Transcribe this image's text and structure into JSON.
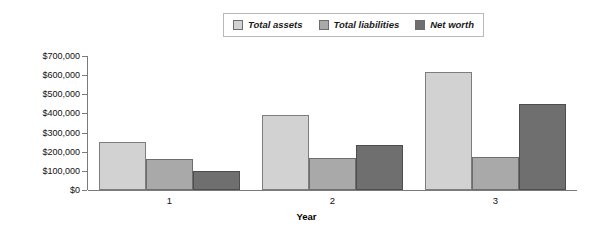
{
  "chart_data": {
    "type": "bar",
    "title": "",
    "xlabel": "Year",
    "ylabel": "",
    "categories": [
      "1",
      "2",
      "3"
    ],
    "series": [
      {
        "name": "Total assets",
        "values": [
          250000,
          390000,
          615000
        ],
        "color": "#d2d2d2"
      },
      {
        "name": "Total liabilities",
        "values": [
          160000,
          165000,
          170000
        ],
        "color": "#a9a9a9"
      },
      {
        "name": "Net worth",
        "values": [
          100000,
          235000,
          450000
        ],
        "color": "#6f6f6f"
      }
    ],
    "ylim": [
      0,
      700000
    ],
    "ytick_values": [
      0,
      100000,
      200000,
      300000,
      400000,
      500000,
      600000,
      700000
    ],
    "ytick_labels": [
      "$0",
      "$100,000",
      "$200,000",
      "$300,000",
      "$400,000",
      "$500,000",
      "$600,000",
      "$700,000"
    ],
    "grid": false,
    "legend_position": "top-center"
  },
  "legend": {
    "entries": [
      {
        "label": "Total assets"
      },
      {
        "label": "Total liabilities"
      },
      {
        "label": "Net worth"
      }
    ]
  },
  "axes": {
    "x_title": "Year",
    "x_categories": [
      "1",
      "2",
      "3"
    ],
    "y_labels": [
      "$700,000",
      "$600,000",
      "$500,000",
      "$400,000",
      "$300,000",
      "$200,000",
      "$100,000",
      "$0"
    ]
  }
}
